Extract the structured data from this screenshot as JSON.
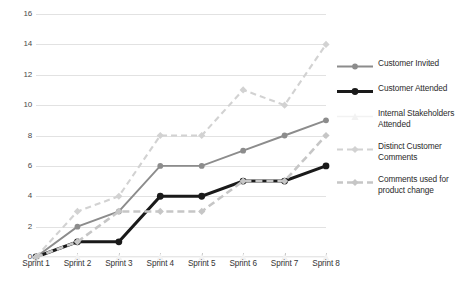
{
  "chart_data": {
    "type": "line",
    "title": "",
    "xlabel": "",
    "ylabel": "",
    "categories": [
      "Sprint 1",
      "Sprint 2",
      "Sprint 3",
      "Sprint 4",
      "Sprint 5",
      "Sprint 6",
      "Sprint 7",
      "Sprint 8"
    ],
    "ylim": [
      0,
      16
    ],
    "ytick_step": 2,
    "yticks": [
      0,
      2,
      4,
      6,
      8,
      10,
      12,
      14,
      16
    ],
    "ytick_labels": [
      "0",
      "2",
      "4",
      "6",
      "8",
      "10",
      "12",
      "14",
      "16"
    ],
    "grid": "horizontal",
    "legend_position": "right",
    "series": [
      {
        "name": "Customer Invited",
        "values": [
          0,
          2,
          3,
          6,
          6,
          7,
          8,
          9
        ],
        "color": "#8c8c8c",
        "line_style": "solid",
        "marker": "circle",
        "line_width": 1.9
      },
      {
        "name": "Customer Attended",
        "values": [
          0,
          1,
          1,
          4,
          4,
          5,
          5,
          6
        ],
        "color": "#1a1a1a",
        "line_style": "solid",
        "marker": "circle",
        "line_width": 3.1
      },
      {
        "name": "Internal Stakeholders Attended",
        "values": [
          0,
          0,
          0,
          0,
          0,
          0,
          0,
          0
        ],
        "color": "#f2f2f2",
        "line_style": "solid",
        "marker": "triangle",
        "line_width": 1.6
      },
      {
        "name": "Distinct Customer Comments",
        "values": [
          0,
          3,
          4,
          8,
          8,
          11,
          10,
          14
        ],
        "color": "#d2d2d2",
        "line_style": "dashed",
        "marker": "diamond",
        "line_width": 2.1
      },
      {
        "name": "Comments used for product change",
        "values": [
          0,
          1,
          3,
          3,
          3,
          5,
          5,
          8
        ],
        "color": "#c6c6c6",
        "line_style": "dashed",
        "marker": "diamond",
        "line_width": 2.6
      }
    ]
  },
  "legend": {
    "items": [
      {
        "label": "Customer Invited"
      },
      {
        "label": "Customer Attended"
      },
      {
        "label": "Internal Stakeholders Attended"
      },
      {
        "label": "Distinct Customer Comments"
      },
      {
        "label": "Comments used for product change"
      }
    ]
  },
  "colors": {
    "background": "#ffffff",
    "gridline": "#e2e2e2",
    "axis": "#c8c8c8",
    "tick_text": "#4a4a4a",
    "label_text": "#333333"
  }
}
